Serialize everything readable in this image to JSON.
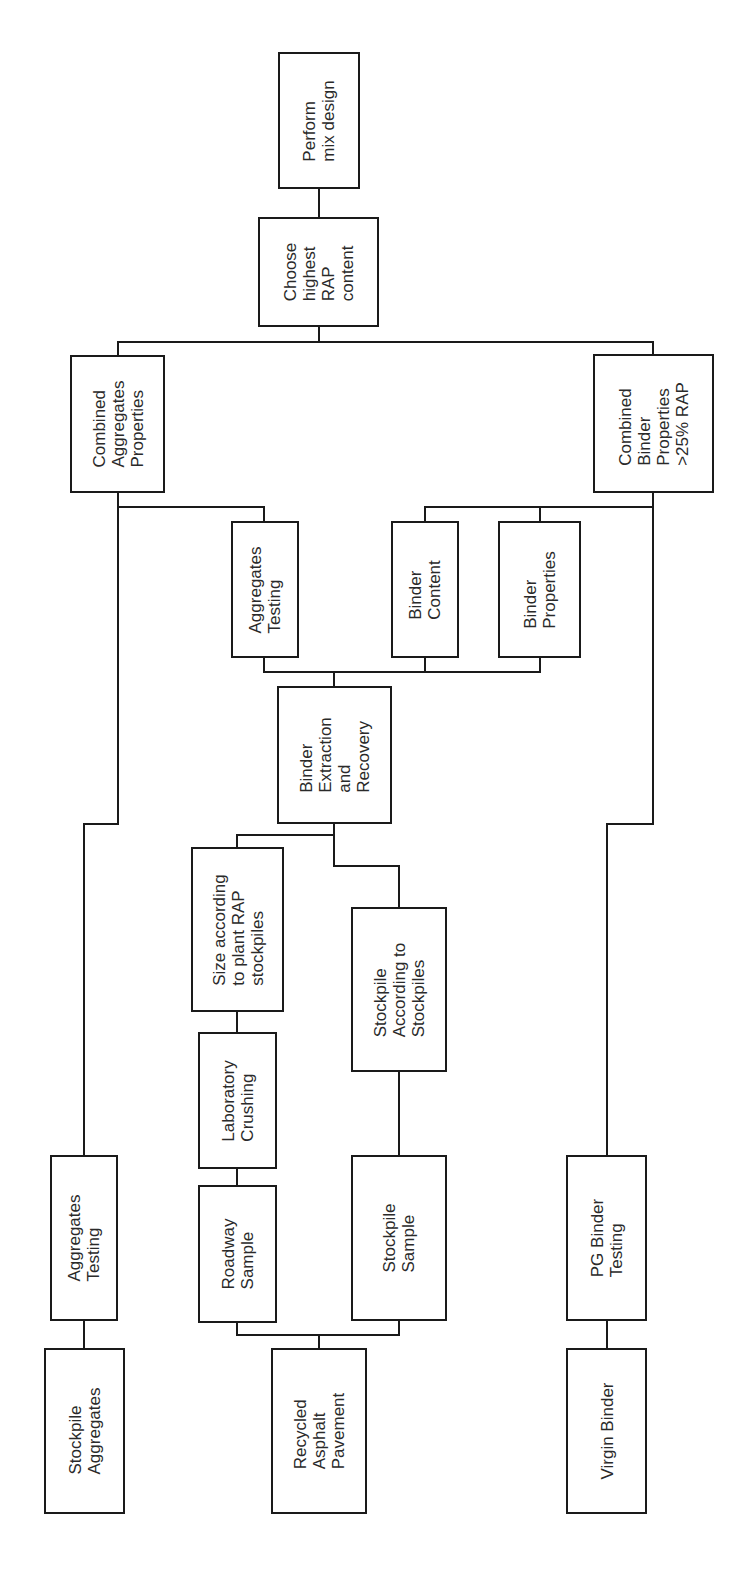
{
  "diagram": {
    "orientation": "rotated-90-ccw",
    "line_color": "#1a1a1a",
    "nodes": [
      {
        "id": "perform-mix-design",
        "label": "Perform\nmix design",
        "box": [
          278,
          52,
          360,
          189
        ]
      },
      {
        "id": "choose-highest-rap",
        "label": "Choose\nhighest\nRAP\ncontent",
        "box": [
          258,
          217,
          379,
          327
        ]
      },
      {
        "id": "combined-aggregates-properties",
        "label": "Combined\nAggregates\nProperties",
        "box": [
          70,
          355,
          165,
          493
        ]
      },
      {
        "id": "combined-binder-properties",
        "label": "Combined\nBinder\nProperties\n>25% RAP",
        "box": [
          593,
          354,
          714,
          493
        ]
      },
      {
        "id": "aggregates-testing-rap",
        "label": "Aggregates\nTesting",
        "box": [
          231,
          521,
          299,
          658
        ]
      },
      {
        "id": "binder-content",
        "label": "Binder\nContent",
        "box": [
          391,
          521,
          459,
          658
        ]
      },
      {
        "id": "binder-properties",
        "label": "Binder\nProperties",
        "box": [
          498,
          521,
          581,
          658
        ]
      },
      {
        "id": "binder-extraction-recovery",
        "label": "Binder\nExtraction\nand\nRecovery",
        "box": [
          277,
          686,
          392,
          824
        ]
      },
      {
        "id": "size-according-plant",
        "label": "Size according\nto plant RAP\nstockpiles",
        "box": [
          191,
          847,
          284,
          1012
        ]
      },
      {
        "id": "stockpile-according",
        "label": "Stockpile\nAccording to\nStockpiles",
        "box": [
          351,
          907,
          447,
          1072
        ]
      },
      {
        "id": "laboratory-crushing",
        "label": "Laboratory\nCrushing",
        "box": [
          198,
          1032,
          277,
          1169
        ]
      },
      {
        "id": "roadway-sample",
        "label": "Roadway\nSample",
        "box": [
          198,
          1185,
          277,
          1323
        ]
      },
      {
        "id": "stockpile-sample",
        "label": "Stockpile\nSample",
        "box": [
          351,
          1155,
          447,
          1321
        ]
      },
      {
        "id": "aggregates-testing-virgin",
        "label": "Aggregates\nTesting",
        "box": [
          50,
          1155,
          118,
          1321
        ]
      },
      {
        "id": "stockpile-aggregates",
        "label": "Stockpile\nAggregates",
        "box": [
          44,
          1348,
          125,
          1514
        ]
      },
      {
        "id": "recycled-asphalt-pavement",
        "label": "Recycled\nAsphalt\nPavement",
        "box": [
          271,
          1348,
          367,
          1514
        ]
      },
      {
        "id": "pg-binder-testing",
        "label": "PG Binder\nTesting",
        "box": [
          566,
          1155,
          647,
          1321
        ]
      },
      {
        "id": "virgin-binder",
        "label": "Virgin Binder",
        "box": [
          566,
          1348,
          647,
          1514
        ]
      }
    ],
    "edges": [
      {
        "from": "choose-highest-rap",
        "to": "perform-mix-design",
        "points": "319,217 319,189"
      },
      {
        "from": "combined-aggregates-properties",
        "to": "choose-highest-rap",
        "points": "118,355 118,342 653,342 653,354"
      },
      {
        "from": "choose-highest-rap-stem",
        "to": "bracket",
        "points": "319,327 319,342"
      },
      {
        "from": "aggregates-testing-rap",
        "to": "combined-aggregates-properties",
        "points": "264,521 264,507 118,507 118,493"
      },
      {
        "from": "binder-content",
        "to": "combined-binder-properties",
        "points": "425,521 425,507 653,507 653,493"
      },
      {
        "from": "binder-properties",
        "to": "combined-binder-properties",
        "points": "540,521 540,507"
      },
      {
        "from": "extraction-bracket",
        "to": "tests",
        "points": "264,658 264,672 540,672 540,658"
      },
      {
        "from": "binder-content-stem",
        "to": "bracket",
        "points": "425,658 425,672"
      },
      {
        "from": "binder-extraction-recovery",
        "to": "bracket",
        "points": "334,686 334,672"
      },
      {
        "from": "stockpile-aggregates-chain",
        "to": "combined-aggregates-properties",
        "points": "84,1155 84,824 118,824 118,507"
      },
      {
        "from": "virgin-binder-chain",
        "to": "combined-binder-properties",
        "points": "607,1155 607,824 653,824 653,507"
      },
      {
        "from": "size-according-plant",
        "to": "binder-extraction-recovery",
        "points": "237,847 237,835 334,835 334,824"
      },
      {
        "from": "stockpile-according",
        "to": "binder-extraction-recovery",
        "points": "399,907 399,866 334,866 334,835"
      },
      {
        "from": "laboratory-crushing",
        "to": "size-according-plant",
        "points": "237,1032 237,1012"
      },
      {
        "from": "roadway-sample",
        "to": "laboratory-crushing",
        "points": "237,1185 237,1169"
      },
      {
        "from": "stockpile-sample",
        "to": "stockpile-according",
        "points": "399,1155 399,1072"
      },
      {
        "from": "recycled-asphalt-pavement",
        "to": "samples",
        "points": "237,1323 237,1335 399,1335 399,1321"
      },
      {
        "from": "rap-stem",
        "to": "bracket",
        "points": "319,1348 319,1335"
      },
      {
        "from": "stockpile-aggregates",
        "to": "aggregates-testing-virgin",
        "points": "84,1348 84,1321"
      },
      {
        "from": "virgin-binder",
        "to": "pg-binder-testing",
        "points": "607,1348 607,1321"
      }
    ]
  }
}
